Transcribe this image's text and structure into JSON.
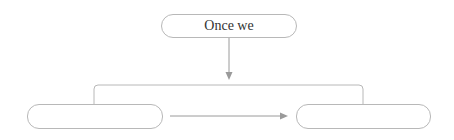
{
  "diagram": {
    "nodes": [
      {
        "id": "top",
        "label": "Once we"
      },
      {
        "id": "left",
        "label": ""
      },
      {
        "id": "right",
        "label": ""
      }
    ],
    "edges": [
      {
        "from": "top",
        "to": "bracket",
        "type": "arrow-down"
      },
      {
        "from": "bracket",
        "to": "left",
        "type": "line"
      },
      {
        "from": "bracket",
        "to": "right",
        "type": "line"
      },
      {
        "from": "left",
        "to": "right",
        "type": "arrow-right"
      }
    ],
    "colors": {
      "stroke": "#b8b8b8",
      "arrow": "#999999",
      "text": "#333333"
    }
  }
}
